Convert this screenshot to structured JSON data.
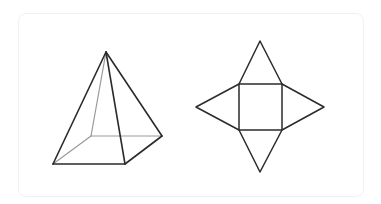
{
  "diagram": {
    "colors": {
      "edge": "#2b2b2b",
      "hidden_edge": "#9a9a9a",
      "card_border": "#f1f1f1",
      "background": "#ffffff"
    },
    "pyramid": {
      "apex": [
        106,
        52
      ],
      "base": {
        "front_left": [
          53,
          164
        ],
        "front_right": [
          125,
          164
        ],
        "back_right": [
          162,
          136
        ],
        "back_left_hidden": [
          91,
          136
        ]
      }
    },
    "net": {
      "square": {
        "x": 239,
        "y": 84,
        "w": 43,
        "h": 46
      },
      "triangles": {
        "top_apex": [
          260,
          41
        ],
        "bottom_apex": [
          260,
          172
        ],
        "left_apex": [
          196,
          107
        ],
        "right_apex": [
          324,
          107
        ]
      }
    }
  }
}
